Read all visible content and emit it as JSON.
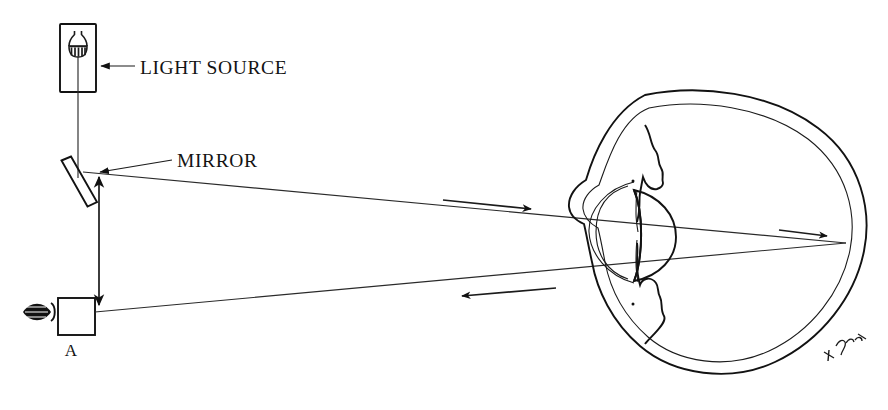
{
  "figure": {
    "background_color": "#ffffff",
    "ink_color": "#121212",
    "width": 888,
    "height": 410
  },
  "labels": {
    "light_source": "LIGHT SOURCE",
    "mirror": "MIRROR",
    "observer_point": "A",
    "signature": "artist-signature"
  },
  "components": [
    {
      "name": "light-source-box",
      "label": "LIGHT SOURCE",
      "icon": "lamp-filament-icon"
    },
    {
      "name": "mirror-plate",
      "label": "MIRROR",
      "icon": "tilted-mirror-icon"
    },
    {
      "name": "observer-eye-icon",
      "label": "A",
      "icon": "eye-icon"
    },
    {
      "name": "aperture-box",
      "label": "A",
      "icon": "box-icon"
    },
    {
      "name": "eyeball-diagram",
      "label": "",
      "icon": "eye-cross-section-icon"
    }
  ],
  "annotations": {
    "light_source_pointer": "arrow-left-icon",
    "mirror_pointer": "arrow-left-icon",
    "distance_arrow": "double-headed-vertical-arrow-icon",
    "incoming_ray_arrow": "arrow-right-icon",
    "outgoing_ray_arrow": "arrow-left-icon"
  },
  "eye_parts": [
    "sclera-outer",
    "sclera-inner",
    "cornea",
    "iris-upper",
    "iris-lower",
    "crystalline-lens",
    "retina-focus-point"
  ]
}
